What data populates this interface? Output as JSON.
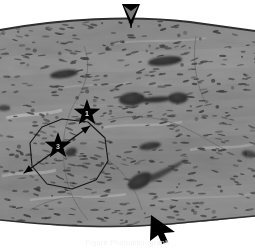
{
  "figure": {
    "kind": "histology-micrograph",
    "modality": "light microscopy, H&E stained tissue section",
    "caption": "Figure  Photomicrograph",
    "background_color": "#ffffff"
  },
  "tissue": {
    "description": "Grayscale fibrous tissue section with dense elongated spindle nuclei",
    "base_gray": "#a9a9a9",
    "light_gray": "#d2d2d2",
    "mid_gray": "#9a9a9a",
    "dark_gray": "#6d6d6d",
    "nucleus_color": "#4a4a4a",
    "border_color": "#3a3a3a",
    "nuclei_count": 520,
    "top_edge_label": "curved superior tissue border",
    "bottom_edge_label": "curved inferior tissue border"
  },
  "lumens": [
    {
      "name": "lumen-upper-left",
      "cx": 64,
      "cy": 74,
      "rx": 14,
      "ry": 4.0,
      "rot": -8
    },
    {
      "name": "lumen-upper-right",
      "cx": 165,
      "cy": 61,
      "rx": 17,
      "ry": 4.5,
      "rot": -6
    },
    {
      "name": "lumen-dumbbell-left",
      "cx": 132,
      "cy": 99,
      "rx": 13,
      "ry": 6.5,
      "rot": -4
    },
    {
      "name": "lumen-dumbbell-right",
      "cx": 178,
      "cy": 98,
      "rx": 10,
      "ry": 5.5,
      "rot": -2
    },
    {
      "name": "lumen-mid-right",
      "cx": 150,
      "cy": 146,
      "rx": 11,
      "ry": 3.5,
      "rot": -9
    },
    {
      "name": "lumen-teardrop",
      "cx": 140,
      "cy": 181,
      "rx": 13,
      "ry": 7.0,
      "rot": -28
    },
    {
      "name": "lumen-edge-left",
      "cx": 4,
      "cy": 108,
      "rx": 6,
      "ry": 3.0,
      "rot": 0
    },
    {
      "name": "lumen-edge-right",
      "cx": 249,
      "cy": 154,
      "rx": 7,
      "ry": 3.5,
      "rot": 10
    },
    {
      "name": "lumen-in-polygon",
      "cx": 71,
      "cy": 152,
      "rx": 6,
      "ry": 4.0,
      "rot": -20
    }
  ],
  "annotations": {
    "stars": [
      {
        "name": "star-marker-1",
        "label": "1",
        "cx": 87,
        "cy": 113,
        "radius": 14,
        "color": "#000000",
        "label_color": "#e8e8e8"
      },
      {
        "name": "star-marker-3",
        "label": "3",
        "cx": 58,
        "cy": 146,
        "radius": 14,
        "color": "#000000",
        "label_color": "#c8c8c8"
      }
    ],
    "polygon": {
      "name": "region-of-interest-polygon",
      "shape": "octagon",
      "stroke": "#151515",
      "stroke_width": 1.1,
      "points": "42,127 62,119 88,122 105,138 108,161 96,180 72,189 47,184 32,166 30,143"
    },
    "measure_arrow": {
      "name": "double-headed-measure-arrow",
      "stroke": "#101010",
      "stroke_width": 1.3,
      "x1": 24,
      "y1": 173,
      "x2": 90,
      "y2": 126,
      "heads": "both"
    },
    "edge_markers": [
      {
        "name": "arrowhead-top",
        "x": 131,
        "y": 8,
        "direction": "down",
        "color": "#000000"
      },
      {
        "name": "arrowhead-bottom",
        "x": 158,
        "y": 222,
        "direction": "up-left",
        "color": "#000000"
      }
    ]
  },
  "chart_data": {
    "type": "scatter",
    "xlabel": "",
    "ylabel": "",
    "xlim": [
      0,
      255
    ],
    "ylim": [
      0,
      249
    ],
    "grid": false,
    "legend": "none",
    "annotations": [
      {
        "label": "1",
        "x": 87,
        "y": 113,
        "marker": "star"
      },
      {
        "label": "3",
        "x": 58,
        "y": 146,
        "marker": "star"
      },
      {
        "label": "arrowhead-top",
        "x": 131,
        "y": 8,
        "marker": "triangle-down"
      },
      {
        "label": "arrowhead-bottom",
        "x": 158,
        "y": 222,
        "marker": "triangle-up-left"
      }
    ]
  }
}
